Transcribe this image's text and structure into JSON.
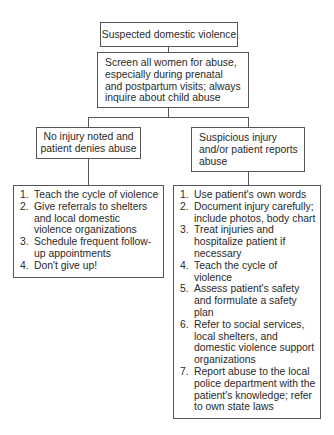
{
  "diagram": {
    "type": "flowchart",
    "root": {
      "label": "Suspected domestic violence"
    },
    "screen": {
      "label": "Screen all women for abuse, especially during prenatal and postpartum visits; always inquire about child abuse",
      "lines": [
        "Screen all women for abuse,",
        "especially during prenatal",
        "and postpartum visits; always",
        "inquire about child abuse"
      ]
    },
    "branches": [
      {
        "condition": "No injury noted and patient denies abuse",
        "condition_lines": [
          "No injury noted and",
          "patient denies abuse"
        ],
        "actions": [
          {
            "num": "1.",
            "text": "Teach the cycle of violence"
          },
          {
            "num": "2.",
            "text": "Give referrals to shelters and local domestic violence organizations"
          },
          {
            "num": "3.",
            "text": "Schedule frequent follow-up appointments"
          },
          {
            "num": "4.",
            "text": "Don't give up!"
          }
        ]
      },
      {
        "condition": "Suspicious injury and/or patient reports abuse",
        "condition_lines": [
          "Suspicious injury",
          "and/or patient reports",
          "abuse"
        ],
        "actions": [
          {
            "num": "1.",
            "text": "Use patient's own words"
          },
          {
            "num": "2.",
            "text": "Document injury carefully; include photos, body chart"
          },
          {
            "num": "3.",
            "text": "Treat injuries and hospitalize patient if necessary"
          },
          {
            "num": "4.",
            "text": "Teach the cycle of violence"
          },
          {
            "num": "5.",
            "text": "Assess patient's safety and formulate a safety plan"
          },
          {
            "num": "6.",
            "text": "Refer to social services, local shelters, and domestic violence support organizations"
          },
          {
            "num": "7.",
            "text": "Report abuse to the local police department with the patient's knowledge; refer to own state laws"
          }
        ]
      }
    ]
  }
}
